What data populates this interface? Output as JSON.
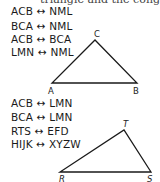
{
  "header_fragment": "triangle and the congru",
  "group1": {
    "correspondences": [
      {
        "left": "ACB",
        "arrow": "↔",
        "right": "NML"
      },
      {
        "left": "BCA",
        "arrow": "↔",
        "right": "NML"
      },
      {
        "left": "ACB",
        "arrow": "↔",
        "right": "BCA"
      },
      {
        "left": "LMN",
        "arrow": "↔",
        "right": "NML"
      }
    ],
    "triangle": {
      "name": "ABC",
      "vertices": {
        "A": "A",
        "B": "B",
        "C": "C"
      }
    }
  },
  "group2": {
    "correspondences": [
      {
        "left": "ACB",
        "arrow": "↔",
        "right": "LMN"
      },
      {
        "left": "BCA",
        "arrow": "↔",
        "right": "LMN"
      },
      {
        "left": "RTS",
        "arrow": "↔",
        "right": "EFD"
      },
      {
        "left": "HIJK",
        "arrow": "↔",
        "right": "XYZW"
      }
    ],
    "triangle": {
      "name": "RST",
      "vertices": {
        "R": "R",
        "S": "S",
        "T": "T"
      }
    }
  }
}
